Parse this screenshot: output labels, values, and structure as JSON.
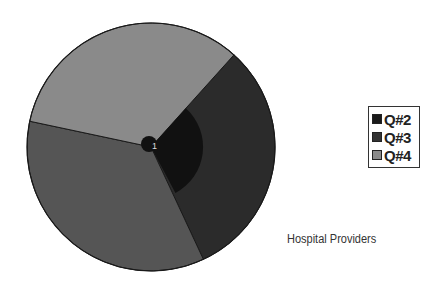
{
  "chart_data": {
    "type": "pie",
    "title": "",
    "caption": "Hospital Providers",
    "center_label": "1",
    "slices": [
      {
        "name": "Q#3",
        "start_deg": 42,
        "end_deg": 155,
        "percent": 31.4,
        "color": "#2b2b2b",
        "radius_frac": 1.0
      },
      {
        "name": "(unlabeled)",
        "start_deg": 155,
        "end_deg": 282,
        "percent": 35.3,
        "color": "#555555",
        "radius_frac": 1.0
      },
      {
        "name": "Q#4",
        "start_deg": 282,
        "end_deg": 402,
        "percent": 33.3,
        "color": "#8a8a8a",
        "radius_frac": 1.0
      },
      {
        "name": "Q#2",
        "start_deg": 42,
        "end_deg": 152,
        "percent": 30.6,
        "color": "#111111",
        "radius_frac": 0.42
      }
    ],
    "legend": [
      {
        "label": "Q#2",
        "color": "#1a1a1a"
      },
      {
        "label": "Q#3",
        "color": "#333333"
      },
      {
        "label": "Q#4",
        "color": "#8a8a8a"
      }
    ],
    "legend_position": "right"
  }
}
